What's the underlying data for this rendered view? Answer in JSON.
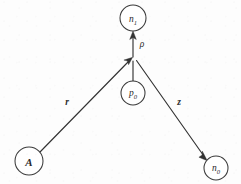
{
  "figure": {
    "type": "directed-graph-diagram",
    "width": 241,
    "height": 184,
    "background_color": "#fdfdfd",
    "stroke_color": "#333333",
    "label_color": "#2b2b2b",
    "nodes": [
      {
        "id": "n1",
        "base": "n",
        "sub": "1",
        "label": "n1",
        "cx": 133,
        "cy": 18,
        "r": 13
      },
      {
        "id": "p0",
        "base": "p",
        "sub": "0",
        "label": "p0",
        "cx": 133,
        "cy": 93,
        "r": 12
      },
      {
        "id": "A",
        "base": "A",
        "sub": "",
        "label": "A",
        "cx": 29,
        "cy": 161,
        "r": 14
      },
      {
        "id": "n0",
        "base": "n",
        "sub": "0",
        "label": "n0",
        "cx": 216,
        "cy": 168,
        "r": 12
      }
    ],
    "vertex": {
      "x": 133,
      "y": 57
    },
    "edges": [
      {
        "id": "edge-rho",
        "label": "ρ",
        "from": "p0",
        "to": "n1",
        "bold": false,
        "label_x": 142,
        "label_y": 44
      },
      {
        "id": "edge-r",
        "label": "r",
        "from": "A",
        "to": "vertex",
        "bold": true,
        "label_x": 67,
        "label_y": 102
      },
      {
        "id": "edge-z",
        "label": "z",
        "from": "vertex",
        "to": "n0",
        "bold": true,
        "label_x": 179,
        "label_y": 102
      }
    ]
  }
}
